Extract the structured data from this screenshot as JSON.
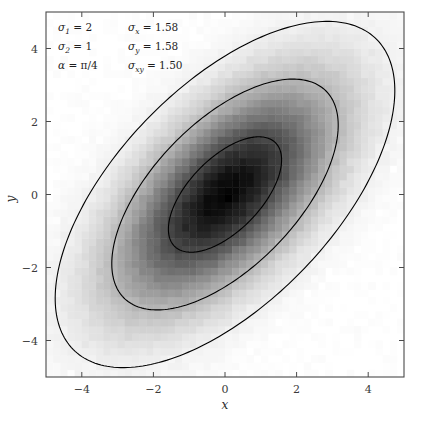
{
  "chart_data": {
    "type": "heatmap",
    "subtype": "2d-histogram-with-contours",
    "title": "",
    "xlabel": "x",
    "ylabel": "y",
    "xlim": [
      -5,
      5
    ],
    "ylim": [
      -5,
      5
    ],
    "xticks": [
      -4,
      -2,
      0,
      2,
      4
    ],
    "yticks": [
      -4,
      -2,
      0,
      2,
      4
    ],
    "xtick_labels": [
      "−4",
      "−2",
      "0",
      "2",
      "4"
    ],
    "ytick_labels": [
      "−4",
      "−2",
      "0",
      "2",
      "4"
    ],
    "grid": false,
    "legend": "none",
    "colormap": "gray_reversed",
    "bins": 50,
    "bin_width": 0.2,
    "distribution": {
      "family": "bivariate-normal",
      "mean": [
        0,
        0
      ],
      "sigma_1": 2,
      "sigma_2": 1,
      "alpha_radians": 0.7853981634,
      "alpha_label": "π/4",
      "sigma_x": 1.58,
      "sigma_y": 1.58,
      "sigma_xy": 1.5,
      "covariance": [
        [
          2.5,
          1.5
        ],
        [
          1.5,
          2.5
        ]
      ],
      "correlation": 0.6
    },
    "contours": {
      "count": 3,
      "levels_in_sigma": [
        1,
        2,
        3
      ],
      "color": "#000000",
      "line_width": 1.1,
      "orientation_degrees": 45
    }
  },
  "annotation": {
    "rows": [
      {
        "left_symbol": "σ",
        "left_sub": "1",
        "left_value": "2",
        "right_symbol": "σ",
        "right_sub": "x",
        "right_value": "1.58"
      },
      {
        "left_symbol": "σ",
        "left_sub": "2",
        "left_value": "1",
        "right_symbol": "σ",
        "right_sub": "y",
        "right_value": "1.58"
      },
      {
        "left_symbol": "α",
        "left_sub": "",
        "left_value": "π/4",
        "right_symbol": "σ",
        "right_sub": "xy",
        "right_value": "1.50"
      }
    ],
    "equals": "=",
    "line_1_full": "σ₁ = 2    σₓ = 1.58",
    "line_2_full": "σ₂ = 1    σᵧ = 1.58",
    "line_3_full": "α = π/4  σₓᵧ = 1.50"
  },
  "axes": {
    "x_title": "x",
    "y_title": "y",
    "frame_color": "#4a4a4a",
    "tick_color": "#4a4a4a"
  }
}
